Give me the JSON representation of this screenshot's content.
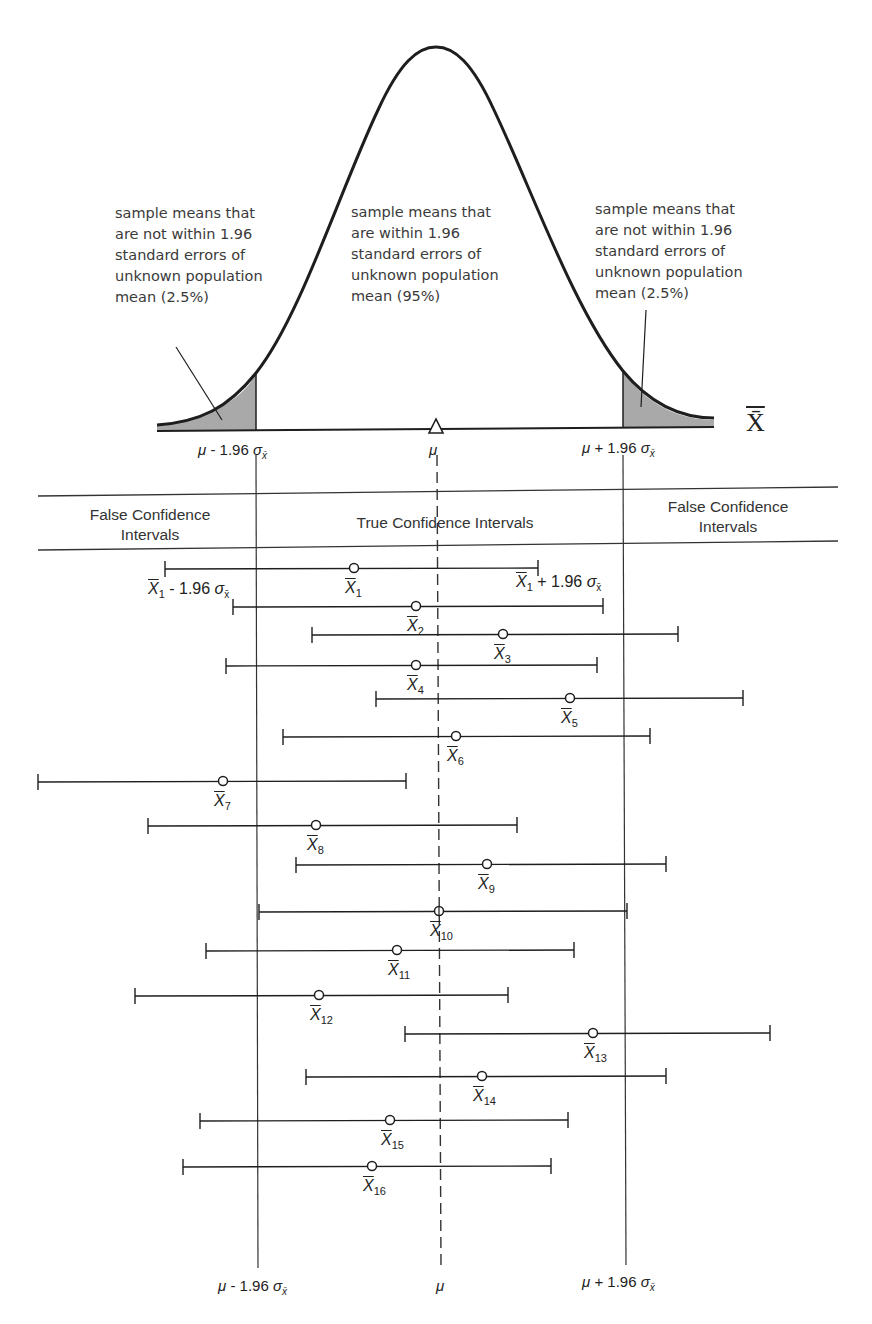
{
  "figure": {
    "axis_symbol": "X̄",
    "annotations": {
      "left_tail": "sample means that\nare not within 1.96\nstandard errors of\nunknown population\nmean (2.5%)",
      "center": "sample means that\nare within 1.96\nstandard errors of\nunknown population\nmean (95%)",
      "right_tail": "sample means that\nare not within 1.96\nstandard errors of\nunknown population\nmean (2.5%)"
    },
    "top_axis_labels": {
      "lower": "μ - 1.96 σ",
      "mean": "μ",
      "upper": "μ + 1.96 σ",
      "sigma_sub": "x̄"
    },
    "zones": {
      "left": "False Confidence\nIntervals",
      "center": "True Confidence Intervals",
      "right": "False Confidence\nIntervals"
    },
    "interval_labels": {
      "first_lower": "X̄",
      "first_lower_suffix": " - 1.96 σ",
      "first_upper_suffix": " + 1.96 σ",
      "sub": "1",
      "sigma_sub": "x̄"
    },
    "bottom_axis_labels": {
      "lower": "μ - 1.96 σ",
      "mean": "μ",
      "upper": "μ + 1.96 σ",
      "sigma_sub": "x̄"
    },
    "colors": {
      "ink": "#1e1e1e",
      "shade": "#a9a9a9",
      "text": "#3a3a3a"
    }
  },
  "chart_data": {
    "type": "diagram",
    "title": "",
    "reference_lines": {
      "mu_minus": 257,
      "mu": 439,
      "mu_plus": 624
    },
    "intervals": [
      {
        "label": "X̄1",
        "lo": 165,
        "mean": 354,
        "hi": 538,
        "y": 569,
        "contains_mu": true
      },
      {
        "label": "X̄2",
        "lo": 233,
        "mean": 416,
        "hi": 603,
        "y": 607,
        "contains_mu": true
      },
      {
        "label": "X̄3",
        "lo": 312,
        "mean": 503,
        "hi": 678,
        "y": 635,
        "contains_mu": true
      },
      {
        "label": "X̄4",
        "lo": 226,
        "mean": 416,
        "hi": 597,
        "y": 666,
        "contains_mu": true
      },
      {
        "label": "X̄5",
        "lo": 376,
        "mean": 570,
        "hi": 743,
        "y": 699,
        "contains_mu": true
      },
      {
        "label": "X̄6",
        "lo": 283,
        "mean": 456,
        "hi": 650,
        "y": 737,
        "contains_mu": true
      },
      {
        "label": "X̄7",
        "lo": 38,
        "mean": 223,
        "hi": 406,
        "y": 782,
        "contains_mu": false
      },
      {
        "label": "X̄8",
        "lo": 148,
        "mean": 316,
        "hi": 517,
        "y": 826,
        "contains_mu": true
      },
      {
        "label": "X̄9",
        "lo": 296,
        "mean": 487,
        "hi": 666,
        "y": 865,
        "contains_mu": true
      },
      {
        "label": "X̄10",
        "lo": 259,
        "mean": 439,
        "hi": 627,
        "y": 912,
        "contains_mu": true
      },
      {
        "label": "X̄11",
        "lo": 206,
        "mean": 397,
        "hi": 574,
        "y": 951,
        "contains_mu": true
      },
      {
        "label": "X̄12",
        "lo": 135,
        "mean": 319,
        "hi": 508,
        "y": 996,
        "contains_mu": true
      },
      {
        "label": "X̄13",
        "lo": 405,
        "mean": 593,
        "hi": 770,
        "y": 1034,
        "contains_mu": true
      },
      {
        "label": "X̄14",
        "lo": 306,
        "mean": 482,
        "hi": 666,
        "y": 1077,
        "contains_mu": true
      },
      {
        "label": "X̄15",
        "lo": 200,
        "mean": 390,
        "hi": 568,
        "y": 1121,
        "contains_mu": true
      },
      {
        "label": "X̄16",
        "lo": 183,
        "mean": 372,
        "hi": 551,
        "y": 1167,
        "contains_mu": true
      }
    ]
  }
}
